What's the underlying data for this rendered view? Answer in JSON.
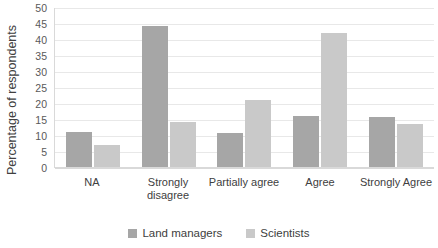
{
  "chart_data": {
    "type": "bar",
    "title": "",
    "xlabel": "",
    "ylabel": "Percentage of respondents",
    "categories": [
      "NA",
      "Strongly disagree",
      "Partially agree",
      "Agree",
      "Strongly Agree"
    ],
    "series": [
      {
        "name": "Land managers",
        "color": "#a6a6a6",
        "values": [
          11,
          44,
          10.5,
          16,
          15.5
        ]
      },
      {
        "name": "Scientists",
        "color": "#c9c9c9",
        "values": [
          7,
          14,
          21,
          42,
          13.5
        ]
      }
    ],
    "ylim": [
      0,
      50
    ],
    "ytick_step": 5,
    "yticks": [
      0,
      5,
      10,
      15,
      20,
      25,
      30,
      35,
      40,
      45,
      50
    ],
    "ytick_labels": [
      "0",
      "5",
      "10",
      "15",
      "20",
      "25",
      "30",
      "35",
      "40",
      "45",
      "50"
    ],
    "grid": true,
    "legend_position": "bottom"
  }
}
